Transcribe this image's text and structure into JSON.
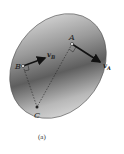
{
  "figure": {
    "caption": "(a)",
    "body_fill_light": "#e8e8e8",
    "body_fill_dark": "#6a6a6a",
    "points": {
      "A": {
        "label": "A",
        "x": 72,
        "y": 44
      },
      "B": {
        "label": "B",
        "x": 23,
        "y": 66
      },
      "C": {
        "label": "C",
        "x": 37,
        "y": 107
      }
    },
    "vectors": {
      "vA": {
        "label": "v",
        "subscript": "A",
        "from": [
          72,
          44
        ],
        "to": [
          101,
          63
        ]
      },
      "vB": {
        "label": "v",
        "subscript": "B",
        "from": [
          23,
          66
        ],
        "to": [
          46,
          58
        ]
      }
    }
  }
}
